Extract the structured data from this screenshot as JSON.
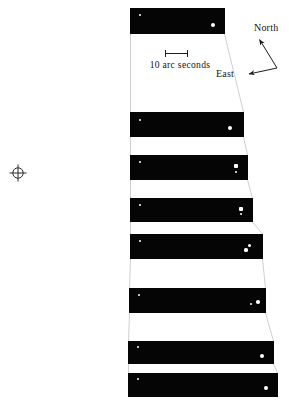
{
  "figure": {
    "background_color": "#ffffff",
    "strip_color": "#050505",
    "star_color": "#ffffff",
    "guide_color": "#c9c9c9",
    "width": 289,
    "height": 404
  },
  "scale": {
    "caption": "10 arc seconds",
    "bar_label": "scale-bar"
  },
  "compass": {
    "north_label": "North",
    "east_label": "East"
  },
  "marker": {
    "symbol_name": "crosshair-target-symbol"
  },
  "observations": [
    {
      "date": "October 19, 1919",
      "label_right": 125,
      "label_top": 13,
      "strip": {
        "left": 130,
        "top": 8,
        "width": 95,
        "height": 26
      },
      "stars": [
        {
          "name": "primary-star",
          "cx": 140,
          "cy": 15,
          "d": 2.6,
          "shape": "round"
        },
        {
          "name": "companion-star",
          "cx": 213,
          "cy": 25,
          "d": 4.0,
          "shape": "round"
        }
      ]
    },
    {
      "date": "October 22, 1933",
      "label_right": 125,
      "label_top": 118,
      "strip": {
        "left": 130,
        "top": 112,
        "width": 114,
        "height": 25
      },
      "stars": [
        {
          "name": "primary-star",
          "cx": 140,
          "cy": 120,
          "d": 2.6,
          "shape": "round"
        },
        {
          "name": "companion-star",
          "cx": 230,
          "cy": 128,
          "d": 4.2,
          "shape": "round"
        }
      ]
    },
    {
      "date": "November 17, 1938",
      "label_right": 125,
      "label_top": 161,
      "strip": {
        "left": 130,
        "top": 155,
        "width": 118,
        "height": 25
      },
      "stars": [
        {
          "name": "primary-star",
          "cx": 140,
          "cy": 162,
          "d": 2.6,
          "shape": "round"
        },
        {
          "name": "companion-star",
          "cx": 236,
          "cy": 166,
          "d": 3.2,
          "shape": "sq"
        },
        {
          "name": "companion-star-faint",
          "cx": 236,
          "cy": 172,
          "d": 2.0,
          "shape": "round"
        }
      ]
    },
    {
      "date": "July 19, 1944",
      "label_right": 125,
      "label_top": 204,
      "strip": {
        "left": 130,
        "top": 198,
        "width": 123,
        "height": 24
      },
      "stars": [
        {
          "name": "primary-star",
          "cx": 140,
          "cy": 205,
          "d": 2.6,
          "shape": "round"
        },
        {
          "name": "companion-star",
          "cx": 241,
          "cy": 209,
          "d": 3.2,
          "shape": "sq"
        },
        {
          "name": "companion-star-faint",
          "cx": 241,
          "cy": 214,
          "d": 2.0,
          "shape": "round"
        }
      ]
    },
    {
      "date": "December 4, 1948",
      "label_right": 125,
      "label_top": 240,
      "strip": {
        "left": 130,
        "top": 234,
        "width": 133,
        "height": 25
      },
      "stars": [
        {
          "name": "primary-star",
          "cx": 140,
          "cy": 241,
          "d": 2.6,
          "shape": "round"
        },
        {
          "name": "companion-star",
          "cx": 249,
          "cy": 245,
          "d": 3.0,
          "shape": "round"
        },
        {
          "name": "companion-star-secondary",
          "cx": 246,
          "cy": 250,
          "d": 3.2,
          "shape": "round"
        }
      ]
    },
    {
      "date": "October 1, 1955",
      "label_right": 125,
      "label_top": 294,
      "strip": {
        "left": 129,
        "top": 288,
        "width": 137,
        "height": 25
      },
      "stars": [
        {
          "name": "primary-star",
          "cx": 139,
          "cy": 295,
          "d": 2.8,
          "shape": "round"
        },
        {
          "name": "companion-star",
          "cx": 258,
          "cy": 302,
          "d": 3.6,
          "shape": "round"
        },
        {
          "name": "companion-star-secondary",
          "cx": 251,
          "cy": 304,
          "d": 2.4,
          "shape": "round"
        }
      ]
    },
    {
      "date": "December 1, 1962",
      "label_right": 125,
      "label_top": 347,
      "strip": {
        "left": 128,
        "top": 341,
        "width": 146,
        "height": 23
      },
      "stars": [
        {
          "name": "primary-star",
          "cx": 138,
          "cy": 347,
          "d": 2.6,
          "shape": "round"
        },
        {
          "name": "companion-star",
          "cx": 262,
          "cy": 356,
          "d": 4.0,
          "shape": "round"
        }
      ]
    },
    {
      "date": "November 18, 1965",
      "label_right": 125,
      "label_top": 379,
      "strip": {
        "left": 128,
        "top": 373,
        "width": 150,
        "height": 24
      },
      "stars": [
        {
          "name": "primary-star",
          "cx": 138,
          "cy": 379,
          "d": 2.6,
          "shape": "round"
        },
        {
          "name": "companion-star",
          "cx": 266,
          "cy": 388,
          "d": 3.8,
          "shape": "round"
        }
      ]
    }
  ]
}
